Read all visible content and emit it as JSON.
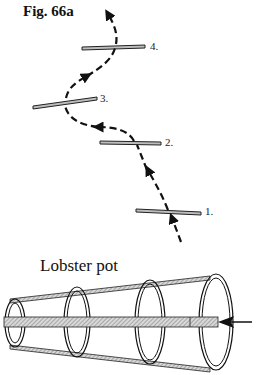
{
  "figure": {
    "title": "Fig. 66a"
  },
  "path_diagram": {
    "bars": [
      {
        "id": "1",
        "label": "1."
      },
      {
        "id": "2",
        "label": "2."
      },
      {
        "id": "3",
        "label": "3."
      },
      {
        "id": "4",
        "label": "4."
      }
    ],
    "path_style": "dashed-with-arrows",
    "direction": "upward from bar 1 to bar 4"
  },
  "lobster_pot": {
    "label": "Lobster pot",
    "rings": 4,
    "entry_arrow": "pointing left into the pot opening"
  },
  "colors": {
    "ink": "#111111",
    "bar_fill": "#bdbdbd",
    "rod_fill": "#c8c8c8",
    "background": "#ffffff"
  }
}
